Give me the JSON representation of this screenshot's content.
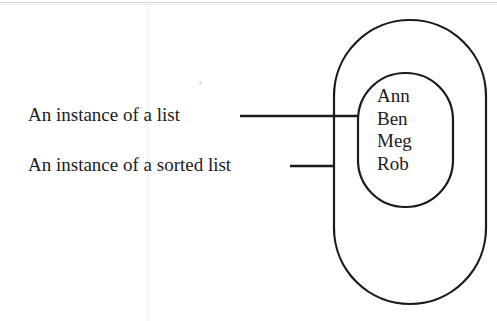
{
  "diagram": {
    "background_color": "#ffffff",
    "stroke_color": "#1b1b1b",
    "annotations": [
      {
        "id": "list",
        "text": "An instance of a list",
        "leader_line": {
          "x1": 240,
          "y1": 116,
          "x2": 358,
          "y2": 116
        },
        "points_to": "inner-sorted-list-shape"
      },
      {
        "id": "sorted-list",
        "text": "An instance of a sorted list",
        "leader_line": {
          "x1": 290,
          "y1": 166,
          "x2": 334,
          "y2": 166
        },
        "points_to": "outer-list-shape"
      }
    ],
    "shapes": [
      {
        "id": "outer-list-shape",
        "name": "list-container",
        "type": "stadium",
        "x": 334,
        "y": 20,
        "width": 152,
        "height": 284,
        "radius": 76
      },
      {
        "id": "inner-sorted-list-shape",
        "name": "sorted-list-container",
        "type": "stadium",
        "x": 358,
        "y": 73,
        "width": 95,
        "height": 134,
        "radius": 47
      }
    ],
    "elements": [
      "Ann",
      "Ben",
      "Meg",
      "Rob"
    ]
  }
}
